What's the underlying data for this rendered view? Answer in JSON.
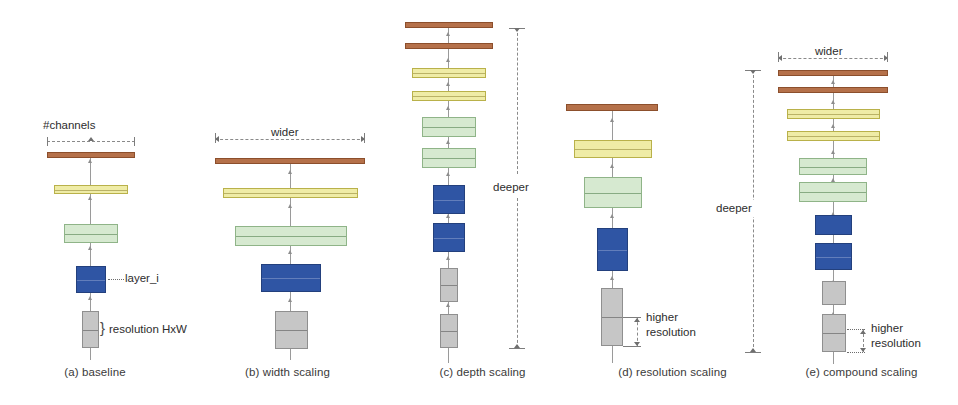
{
  "figure": {
    "background": "#ffffff",
    "colors": {
      "brown": "#b5714a",
      "yellow": "#efeca6",
      "green": "#d6e9d0",
      "blue": "#2f55a4",
      "gray": "#c6c6c6",
      "guide": "#8a8a8a"
    }
  },
  "panels": [
    {
      "id": "a",
      "caption": "(a) baseline",
      "annotations": {
        "channels": "#channels",
        "layer": "layer_i",
        "resolution": "resolution HxW"
      },
      "layers": [
        {
          "color": "brown",
          "w": 88,
          "h": 6
        },
        {
          "color": "yellow",
          "w": 74,
          "h": 9
        },
        {
          "color": "green",
          "w": 54,
          "h": 19
        },
        {
          "color": "blue",
          "w": 30,
          "h": 27
        },
        {
          "color": "gray",
          "w": 17,
          "h": 37
        }
      ]
    },
    {
      "id": "b",
      "caption": "(b) width scaling",
      "annotations": {
        "wider": "wider"
      },
      "layers": [
        {
          "color": "brown",
          "w": 150,
          "h": 6
        },
        {
          "color": "yellow",
          "w": 135,
          "h": 10
        },
        {
          "color": "green",
          "w": 112,
          "h": 20
        },
        {
          "color": "blue",
          "w": 60,
          "h": 28
        },
        {
          "color": "gray",
          "w": 33,
          "h": 38
        }
      ]
    },
    {
      "id": "c",
      "caption": "(c) depth scaling",
      "annotations": {
        "deeper": "deeper"
      },
      "layers": [
        {
          "color": "brown",
          "w": 88,
          "h": 6
        },
        {
          "color": "brown",
          "w": 88,
          "h": 6
        },
        {
          "color": "yellow",
          "w": 74,
          "h": 10
        },
        {
          "color": "yellow",
          "w": 74,
          "h": 10
        },
        {
          "color": "green",
          "w": 54,
          "h": 20
        },
        {
          "color": "green",
          "w": 54,
          "h": 20
        },
        {
          "color": "blue",
          "w": 32,
          "h": 29
        },
        {
          "color": "blue",
          "w": 32,
          "h": 29
        },
        {
          "color": "gray",
          "w": 18,
          "h": 34
        },
        {
          "color": "gray",
          "w": 18,
          "h": 34
        }
      ]
    },
    {
      "id": "d",
      "caption": "(d) resolution scaling",
      "annotations": {
        "higher": "higher",
        "resolution": "resolution"
      },
      "layers": [
        {
          "color": "brown",
          "w": 92,
          "h": 7
        },
        {
          "color": "yellow",
          "w": 78,
          "h": 18
        },
        {
          "color": "green",
          "w": 58,
          "h": 31
        },
        {
          "color": "blue",
          "w": 31,
          "h": 43
        },
        {
          "color": "gray",
          "w": 22,
          "h": 58
        }
      ]
    },
    {
      "id": "e",
      "caption": "(e) compound scaling",
      "annotations": {
        "wider": "wider",
        "deeper": "deeper",
        "higher": "higher",
        "resolution": "resolution"
      },
      "layers": [
        {
          "color": "brown",
          "w": 110,
          "h": 6
        },
        {
          "color": "brown",
          "w": 110,
          "h": 6
        },
        {
          "color": "yellow",
          "w": 93,
          "h": 10
        },
        {
          "color": "yellow",
          "w": 93,
          "h": 10
        },
        {
          "color": "green",
          "w": 68,
          "h": 17
        },
        {
          "color": "green",
          "w": 68,
          "h": 20
        },
        {
          "color": "blue",
          "w": 37,
          "h": 20
        },
        {
          "color": "blue",
          "w": 37,
          "h": 27
        },
        {
          "color": "gray",
          "w": 24,
          "h": 24
        },
        {
          "color": "gray",
          "w": 24,
          "h": 38
        }
      ]
    }
  ]
}
